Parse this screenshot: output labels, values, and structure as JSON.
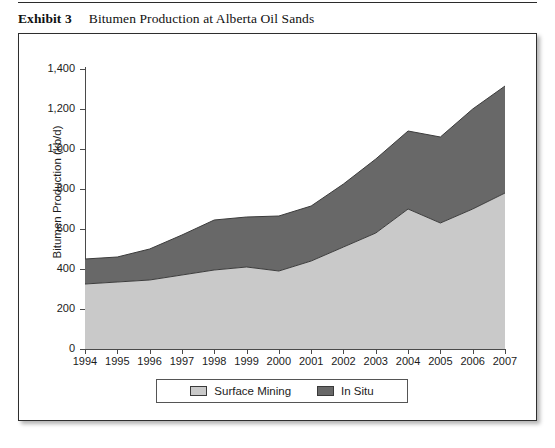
{
  "caption": {
    "label": "Exhibit 3",
    "title": "Bitumen Production at Alberta Oil Sands"
  },
  "colors": {
    "surface_mining": "#c9c9c9",
    "in_situ": "#686868",
    "axis": "#4a4a4a",
    "text": "#1b1b1b",
    "frame": "#2e2e2e"
  },
  "legend": {
    "items": [
      {
        "label": "Surface Mining",
        "color": "#c9c9c9"
      },
      {
        "label": "In Situ",
        "color": "#686868"
      }
    ]
  },
  "axes": {
    "y_title": "Bitumen Production (kb/d)",
    "y_ticks": [
      "0",
      "200",
      "400",
      "600",
      "800",
      "1,000",
      "1,200",
      "1,400"
    ],
    "y_tick_values": [
      0,
      200,
      400,
      600,
      800,
      1000,
      1200,
      1400
    ],
    "x_ticks": [
      "1994",
      "1995",
      "1996",
      "1997",
      "1998",
      "1999",
      "2000",
      "2001",
      "2002",
      "2003",
      "2004",
      "2005",
      "2006",
      "2007"
    ]
  },
  "chart_data": {
    "type": "area",
    "stacked": true,
    "title": "Bitumen Production at Alberta Oil Sands",
    "xlabel": "",
    "ylabel": "Bitumen Production (kb/d)",
    "ylim": [
      0,
      1400
    ],
    "ytick_step": 200,
    "grid": false,
    "legend_position": "bottom",
    "categories": [
      1994,
      1995,
      1996,
      1997,
      1998,
      1999,
      2000,
      2001,
      2002,
      2003,
      2004,
      2005,
      2006,
      2007
    ],
    "series": [
      {
        "name": "Surface Mining",
        "color": "#c9c9c9",
        "values": [
          325,
          335,
          345,
          370,
          395,
          410,
          390,
          440,
          510,
          580,
          700,
          630,
          700,
          780
        ]
      },
      {
        "name": "In Situ",
        "color": "#686868",
        "values": [
          125,
          125,
          155,
          200,
          250,
          250,
          275,
          275,
          315,
          370,
          390,
          430,
          500,
          535
        ]
      }
    ],
    "totals": [
      450,
      460,
      500,
      570,
      645,
      660,
      665,
      715,
      825,
      950,
      1090,
      1060,
      1200,
      1315
    ]
  }
}
